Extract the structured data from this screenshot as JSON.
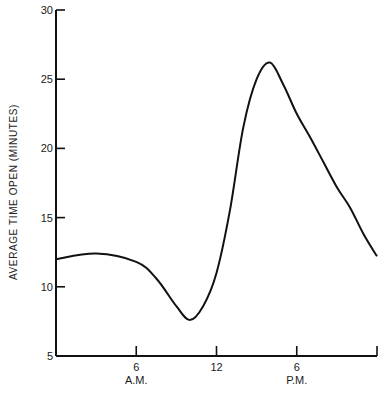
{
  "chart_data": {
    "type": "line",
    "title": "",
    "xlabel": "",
    "ylabel": "AVERAGE TIME OPEN (MINUTES)",
    "xlim": [
      0,
      24
    ],
    "ylim": [
      5,
      30
    ],
    "grid": false,
    "legend": null,
    "y_ticks": [
      5,
      10,
      15,
      20,
      25,
      30
    ],
    "x_ticks": [
      {
        "hour": 6,
        "label": "6",
        "sublabel": "A.M."
      },
      {
        "hour": 12,
        "label": "12",
        "sublabel": ""
      },
      {
        "hour": 18,
        "label": "6",
        "sublabel": "P.M."
      },
      {
        "hour": 24,
        "label": "",
        "sublabel": ""
      }
    ],
    "series": [
      {
        "name": "Average time open",
        "x": [
          0,
          3,
          6,
          7.5,
          9,
          10,
          11,
          12,
          13,
          14,
          15,
          16,
          17,
          18,
          19,
          20,
          21,
          22,
          23,
          24
        ],
        "values": [
          12.0,
          12.4,
          11.8,
          10.6,
          8.6,
          7.6,
          8.6,
          11.0,
          15.5,
          21.5,
          25.0,
          26.2,
          24.6,
          22.5,
          20.8,
          19.0,
          17.2,
          15.7,
          13.8,
          12.2
        ]
      }
    ]
  }
}
